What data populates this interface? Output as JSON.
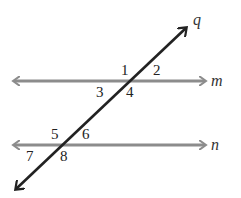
{
  "diagram": {
    "type": "parallel-lines-transversal",
    "lines": {
      "m": {
        "label": "m",
        "color": "#8c8c8c"
      },
      "n": {
        "label": "n",
        "color": "#8c8c8c"
      },
      "q": {
        "label": "q",
        "color": "#222222"
      }
    },
    "angles": [
      {
        "label": "1"
      },
      {
        "label": "2"
      },
      {
        "label": "3"
      },
      {
        "label": "4"
      },
      {
        "label": "5"
      },
      {
        "label": "6"
      },
      {
        "label": "7"
      },
      {
        "label": "8"
      }
    ]
  }
}
